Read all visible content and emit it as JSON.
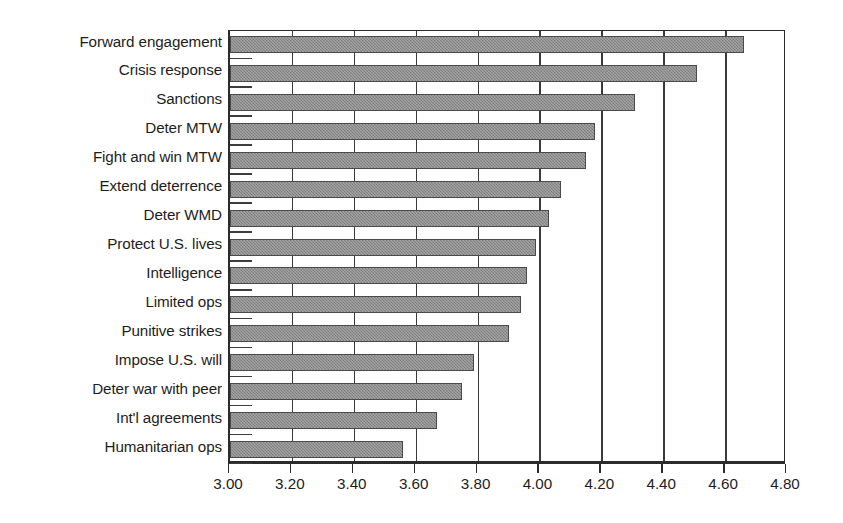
{
  "chart_data": {
    "type": "bar",
    "orientation": "horizontal",
    "title": "",
    "subtitle": "",
    "xlabel": "",
    "ylabel": "",
    "xlim": [
      3.0,
      4.8
    ],
    "xtick_step": 0.2,
    "xticklabels": [
      "3.00",
      "3.20",
      "3.40",
      "3.60",
      "3.80",
      "4.00",
      "4.20",
      "4.40",
      "4.60",
      "4.80"
    ],
    "xticks": [
      3.0,
      3.2,
      3.4,
      3.6,
      3.8,
      4.0,
      4.2,
      4.4,
      4.6,
      4.8
    ],
    "grid": true,
    "grid_axis": "x",
    "legend": false,
    "legend_position": "none",
    "bar_color": "#8a8a8a",
    "bar_edge_color": "#4a4a4a",
    "axis_color": "#2b2b2b",
    "background_color": "#ffffff",
    "categories": [
      "Forward engagement",
      "Crisis response",
      "Sanctions",
      "Deter MTW",
      "Fight and win MTW",
      "Extend deterrence",
      "Deter WMD",
      "Protect U.S. lives",
      "Intelligence",
      "Limited ops",
      "Punitive strikes",
      "Impose U.S. will",
      "Deter war with peer",
      "Int'l agreements",
      "Humanitarian ops"
    ],
    "values": [
      4.66,
      4.51,
      4.31,
      4.18,
      4.15,
      4.07,
      4.03,
      3.99,
      3.96,
      3.94,
      3.9,
      3.79,
      3.75,
      3.67,
      3.56
    ]
  }
}
